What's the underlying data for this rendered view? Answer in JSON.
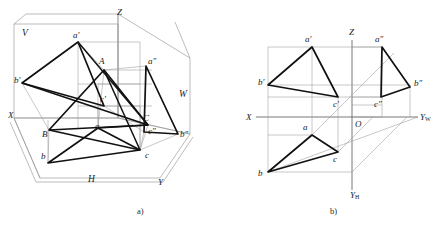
{
  "figure": {
    "background_color": "#ffffff",
    "ink_color": "#1a1a1a",
    "thin_line_color": "#8a8a8a",
    "thick_line_color": "#111111",
    "captions": [
      {
        "id": "caption-a",
        "text": "a)",
        "x": 137,
        "y": 214
      },
      {
        "id": "caption-b",
        "text": "b)",
        "x": 330,
        "y": 214
      }
    ]
  },
  "panel_a": {
    "name": "axonometric-three-plane-system",
    "axis_labels": [
      {
        "id": "axis-x",
        "text": "X",
        "x": 8,
        "y": 116
      },
      {
        "id": "axis-y",
        "text": "Y",
        "x": 158,
        "y": 183
      },
      {
        "id": "axis-z",
        "text": "Z",
        "x": 117,
        "y": 13
      }
    ],
    "plane_labels": [
      {
        "id": "plane-v",
        "text": "V",
        "x": 22,
        "y": 34
      },
      {
        "id": "plane-w",
        "text": "W",
        "x": 179,
        "y": 95
      },
      {
        "id": "plane-h",
        "text": "H",
        "x": 88,
        "y": 180
      }
    ],
    "point_labels": [
      {
        "id": "pt-A-space",
        "text": "A",
        "x": 99,
        "y": 62
      },
      {
        "id": "pt-B-space",
        "text": "B",
        "x": 42,
        "y": 135
      },
      {
        "id": "pt-C-space",
        "text": "C",
        "x": 143,
        "y": 119
      },
      {
        "id": "pt-a-front",
        "text": "a′",
        "x": 73,
        "y": 36
      },
      {
        "id": "pt-b-front",
        "text": "b′",
        "x": 14,
        "y": 81
      },
      {
        "id": "pt-c-front",
        "text": "c′",
        "x": 100,
        "y": 100
      },
      {
        "id": "pt-a-top",
        "text": "a",
        "x": 95,
        "y": 127
      },
      {
        "id": "pt-b-top",
        "text": "b",
        "x": 41,
        "y": 157
      },
      {
        "id": "pt-c-top",
        "text": "c",
        "x": 145,
        "y": 156
      },
      {
        "id": "pt-a-side",
        "text": "a″",
        "x": 148,
        "y": 62
      },
      {
        "id": "pt-b-side",
        "text": "b″",
        "x": 180,
        "y": 135
      },
      {
        "id": "pt-c-side",
        "text": "c″",
        "x": 148,
        "y": 132
      }
    ],
    "triangle_front": {
      "id": "triangle-front-projection",
      "vertices": "78,42 22,83 104,106"
    },
    "triangle_top": {
      "id": "triangle-top-projection",
      "vertices": "98,128 48,163 140,150"
    },
    "triangle_side": {
      "id": "triangle-side-projection",
      "vertices": "146,66 178,134 144,132"
    },
    "triangle_space": {
      "id": "triangle-in-space",
      "vertices": "104,70 49,130 148,125"
    }
  },
  "panel_b": {
    "name": "unfolded-orthographic-projection",
    "axis_labels": [
      {
        "id": "axis-x",
        "text": "X",
        "x": 248,
        "y": 118
      },
      {
        "id": "axis-z",
        "text": "Z",
        "x": 352,
        "y": 33
      },
      {
        "id": "axis-yw",
        "base": "Y",
        "sub": "W",
        "x": 424,
        "y": 118
      },
      {
        "id": "axis-yh",
        "base": "Y",
        "sub": "H",
        "x": 353,
        "y": 196
      },
      {
        "id": "origin-O",
        "text": "O",
        "x": 354,
        "y": 124
      }
    ],
    "point_labels": [
      {
        "id": "pt-a-front",
        "text": "a′",
        "x": 305,
        "y": 40
      },
      {
        "id": "pt-b-front",
        "text": "b′",
        "x": 261,
        "y": 83
      },
      {
        "id": "pt-c-front",
        "text": "c′",
        "x": 333,
        "y": 103
      },
      {
        "id": "pt-a-side",
        "text": "a″",
        "x": 375,
        "y": 40
      },
      {
        "id": "pt-b-side",
        "text": "b″",
        "x": 417,
        "y": 84
      },
      {
        "id": "pt-c-side",
        "text": "c″",
        "x": 376,
        "y": 103
      },
      {
        "id": "pt-a-top",
        "text": "a",
        "x": 303,
        "y": 128
      },
      {
        "id": "pt-b-top",
        "text": "b",
        "x": 261,
        "y": 172
      },
      {
        "id": "pt-c-top",
        "text": "c",
        "x": 333,
        "y": 159
      }
    ],
    "triangle_front": {
      "id": "triangle-front-projection",
      "vertices": "312,47 268,85 338,97"
    },
    "triangle_side": {
      "id": "triangle-side-projection",
      "vertices": "382,47 410,87 381,97"
    },
    "triangle_top": {
      "id": "triangle-top-projection",
      "vertices": "312,135 268,172 338,152"
    }
  }
}
